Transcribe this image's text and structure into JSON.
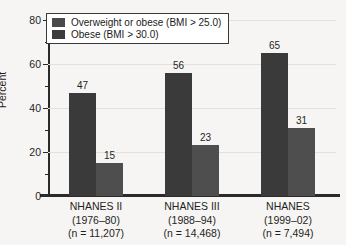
{
  "chart_data": {
    "type": "bar",
    "title": "",
    "xlabel": "",
    "ylabel": "Percent",
    "ylim": [
      0,
      80
    ],
    "ytick_labels": [
      "0",
      "20",
      "40",
      "60",
      "80"
    ],
    "ytick_values": [
      0,
      20,
      40,
      60,
      80
    ],
    "minor_tick_values": [
      10,
      30,
      50,
      70
    ],
    "grid": true,
    "legend_position": "top-left",
    "categories": [
      "NHANES II\n(1976–80)\n(n = 11,207)",
      "NHANES III\n(1988–94)\n(n = 14,468)",
      "NHANES\n(1999–02)\n(n = 7,494)"
    ],
    "category_lines": [
      [
        "NHANES II",
        "(1976–80)",
        "(n = 11,207)"
      ],
      [
        "NHANES III",
        "(1988–94)",
        "(n = 14,468)"
      ],
      [
        "NHANES",
        "(1999–02)",
        "(n = 7,494)"
      ]
    ],
    "series": [
      {
        "name": "Overweight or obese (BMI > 25.0)",
        "color": "#3a3a3a",
        "values": [
          47,
          56,
          65
        ]
      },
      {
        "name": "Obese (BMI > 30.0)",
        "color": "#4e4e4e",
        "values": [
          15,
          23,
          31
        ]
      }
    ]
  },
  "legend": {
    "items": [
      {
        "label": "Overweight or obese (BMI > 25.0)"
      },
      {
        "label": "Obese (BMI > 30.0)"
      }
    ]
  },
  "axes": {
    "y_title": "Percent"
  }
}
